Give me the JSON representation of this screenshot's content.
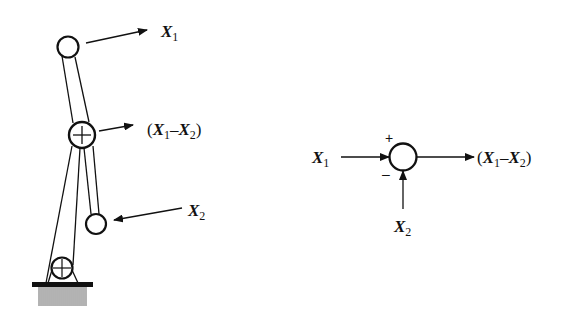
{
  "figure": {
    "left_panel": {
      "name": "pulley-mechanism",
      "labels": {
        "top_output": {
          "var": "X",
          "sub": "1"
        },
        "middle_output": {
          "open": "(",
          "var1": "X",
          "sub1": "1",
          "op": "–",
          "var2": "X",
          "sub2": "2",
          "close": ")"
        },
        "bottom_input": {
          "var": "X",
          "sub": "2"
        }
      },
      "pulleys": [
        {
          "id": "top",
          "type": "plain"
        },
        {
          "id": "middle",
          "type": "cross"
        },
        {
          "id": "right",
          "type": "plain"
        },
        {
          "id": "ground",
          "type": "cross"
        }
      ]
    },
    "right_panel": {
      "name": "summing-junction",
      "labels": {
        "input1": {
          "var": "X",
          "sub": "1"
        },
        "input2": {
          "var": "X",
          "sub": "2"
        },
        "output": {
          "open": "(",
          "var1": "X",
          "sub1": "1",
          "op": "–",
          "var2": "X",
          "sub2": "2",
          "close": ")"
        },
        "plus_sign": "+",
        "minus_sign": "–"
      }
    },
    "colors": {
      "stroke": "#111111",
      "background": "#ffffff"
    }
  }
}
